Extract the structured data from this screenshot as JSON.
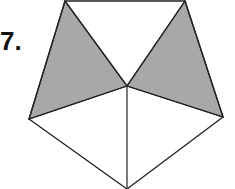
{
  "problem_number": "7.",
  "figure": {
    "shape": "regular pentagon divided into 5 triangles from center",
    "shaded_triangles": 2,
    "total_triangles": 5,
    "shade_color": "#a8a8a8",
    "line_color": "#222222"
  }
}
